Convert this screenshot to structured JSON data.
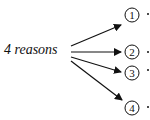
{
  "diagram": {
    "source_label": "4 reasons",
    "targets": [
      {
        "label": "1",
        "cx": 132,
        "cy": 15
      },
      {
        "label": "2",
        "cx": 132,
        "cy": 52
      },
      {
        "label": "3",
        "cx": 132,
        "cy": 73
      },
      {
        "label": "4",
        "cx": 132,
        "cy": 108
      }
    ],
    "stroke_color": "#111111"
  }
}
